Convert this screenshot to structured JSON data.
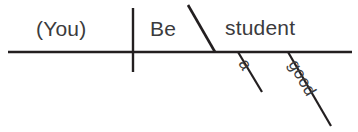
{
  "diagram": {
    "type": "reed-kellogg-sentence-diagram",
    "sentence": "(You) Be a good student.",
    "canvas": {
      "width": 358,
      "height": 132,
      "background": "#ffffff"
    },
    "ink_color": "#231f20",
    "text_color": "#3b3b3d",
    "words": {
      "subject": "(You)",
      "verb": "Be",
      "complement": "student",
      "article": "a",
      "adjective": "good"
    },
    "labels": {
      "subject_role": "subject",
      "verb_role": "linking verb",
      "complement_role": "predicate nominative",
      "article_role": "article modifier",
      "adjective_role": "adjective modifier"
    },
    "lines": {
      "baseline": {
        "x1": 8,
        "y1": 52,
        "x2": 352,
        "y2": 52
      },
      "subject_verb_divider": {
        "x1": 133,
        "y1": 8,
        "x2": 133,
        "y2": 72
      },
      "complement_slant": {
        "x1": 188,
        "y1": 5,
        "x2": 215,
        "y2": 52
      },
      "article_slant": {
        "x1": 238,
        "y1": 52,
        "x2": 262,
        "y2": 92
      },
      "adjective_slant": {
        "x1": 288,
        "y1": 52,
        "x2": 331,
        "y2": 126
      }
    }
  }
}
